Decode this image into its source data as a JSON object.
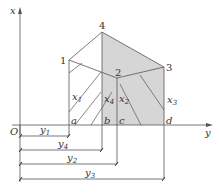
{
  "diagram": {
    "axes": {
      "vertical_label": "x",
      "horizontal_label": "y",
      "origin_label": "O"
    },
    "points": [
      {
        "id": "1",
        "label": "1"
      },
      {
        "id": "2",
        "label": "2"
      },
      {
        "id": "3",
        "label": "3"
      },
      {
        "id": "4",
        "label": "4"
      }
    ],
    "base_points": [
      {
        "id": "a",
        "label": "a"
      },
      {
        "id": "b",
        "label": "b"
      },
      {
        "id": "c",
        "label": "c"
      },
      {
        "id": "d",
        "label": "d"
      }
    ],
    "heights": [
      {
        "id": "x1",
        "base": "x",
        "sub": "1"
      },
      {
        "id": "x2",
        "base": "x",
        "sub": "2"
      },
      {
        "id": "x3",
        "base": "x",
        "sub": "3"
      },
      {
        "id": "x4",
        "base": "x",
        "sub": "4"
      }
    ],
    "dimensions": [
      {
        "id": "y1",
        "base": "y",
        "sub": "1"
      },
      {
        "id": "y4",
        "base": "y",
        "sub": "4"
      },
      {
        "id": "y2",
        "base": "y",
        "sub": "2"
      },
      {
        "id": "y3",
        "base": "y",
        "sub": "3"
      }
    ],
    "colors": {
      "line": "#555555",
      "shade": "#d6d6d6",
      "text": "#333333"
    }
  }
}
